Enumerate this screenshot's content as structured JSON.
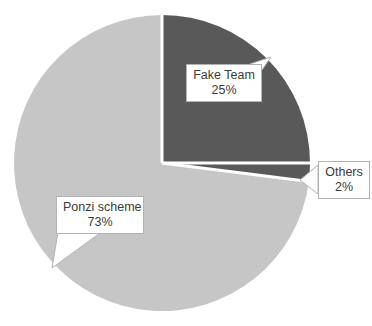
{
  "chart_data": {
    "type": "pie",
    "title": "",
    "labels": [
      "Fake Team",
      "Others",
      "Ponzi scheme"
    ],
    "values": [
      25,
      2,
      73
    ],
    "value_labels": [
      "25%",
      "2%",
      "73%"
    ],
    "unit": "%",
    "colors": [
      "#595959",
      "#595959",
      "#c6c6c6"
    ],
    "legend": "none",
    "slice_separator_color": "#ffffff",
    "start_angle_deg": 0,
    "direction": "clockwise",
    "background": "#ffffff"
  },
  "callouts": {
    "fake_team": {
      "label": "Fake Team",
      "value": "25%"
    },
    "others": {
      "label": "Others",
      "value": "2%"
    },
    "ponzi": {
      "label": "Ponzi scheme",
      "value": "73%"
    }
  },
  "style": {
    "text_color": "#3b3b3b",
    "box_border_color": "#b3b3b3",
    "box_fill": "#ffffff"
  }
}
